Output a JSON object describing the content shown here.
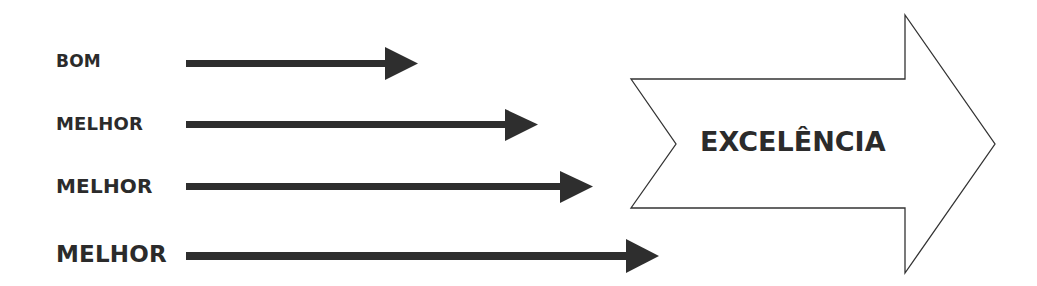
{
  "diagram": {
    "rows": [
      {
        "label": "BOM",
        "font_size": 17
      },
      {
        "label": "MELHOR",
        "font_size": 18
      },
      {
        "label": "MELHOR",
        "font_size": 20
      },
      {
        "label": "MELHOR",
        "font_size": 23
      }
    ],
    "target": {
      "label": "EXCELÊNCIA"
    },
    "colors": {
      "arrow": "#2e2e2e",
      "text": "#2b2b2b",
      "outline": "#333333",
      "background": "#ffffff"
    }
  }
}
